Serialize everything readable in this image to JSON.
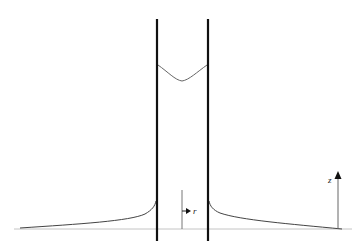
{
  "diagram": {
    "type": "capillary-rise",
    "labels": {
      "r_axis": "r",
      "z_axis": "z"
    },
    "colors": {
      "walls": "#111111",
      "surface": "#444444",
      "baseline": "#bbbbbb",
      "axes": "#555555"
    }
  }
}
